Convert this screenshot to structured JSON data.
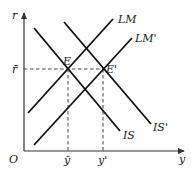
{
  "diagram": {
    "type": "IS-LM economics diagram",
    "axes": {
      "y_axis_label": "r",
      "x_axis_label": "y",
      "origin_label": "O"
    },
    "curves": [
      {
        "id": "LM",
        "label": "LM",
        "slope": "upward"
      },
      {
        "id": "LM_prime",
        "label": "LM'",
        "slope": "upward"
      },
      {
        "id": "IS",
        "label": "IS",
        "slope": "downward"
      },
      {
        "id": "IS_prime",
        "label": "IS'",
        "slope": "downward"
      }
    ],
    "equilibria": [
      {
        "id": "E",
        "label": "E",
        "curves": [
          "LM",
          "IS"
        ]
      },
      {
        "id": "E_prime",
        "label": "E'",
        "curves": [
          "LM_prime",
          "IS_prime"
        ]
      }
    ],
    "tick_labels": {
      "r_bar": "r̄",
      "y_bar": "ȳ",
      "y_prime": "y'"
    },
    "colors": {
      "lines": "#111111",
      "axes": "#333333",
      "background": "#ffffff"
    }
  }
}
